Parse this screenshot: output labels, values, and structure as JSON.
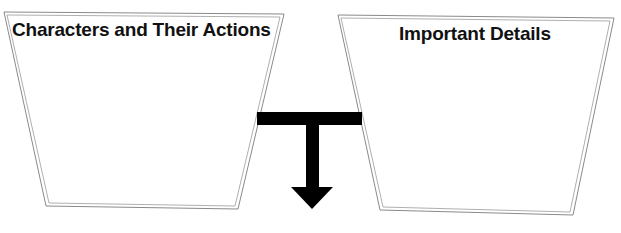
{
  "diagram": {
    "type": "graphic-organizer",
    "boxes": [
      {
        "id": "left",
        "title": "Characters and Their Actions",
        "content": ""
      },
      {
        "id": "right",
        "title": "Important Details",
        "content": ""
      }
    ],
    "connector": {
      "shape": "T-arrow",
      "direction": "down",
      "connects": [
        "left",
        "right"
      ]
    },
    "colors": {
      "outline": "#8a8a8a",
      "arrow": "#000000",
      "text": "#111111",
      "background": "#ffffff"
    }
  }
}
